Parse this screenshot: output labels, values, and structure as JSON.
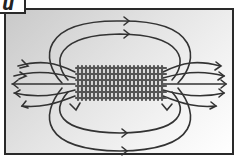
{
  "figure": {
    "label": "u",
    "colors": {
      "line": "#333333",
      "coil": "#555555",
      "frame": "#2a2a2a"
    }
  },
  "diagram": {
    "nodes": [
      {
        "id": "solenoid",
        "type": "coil",
        "turns": 22
      },
      {
        "id": "field-lines-top",
        "count": 2,
        "arrow_direction": "right"
      },
      {
        "id": "field-lines-bottom",
        "count": 2,
        "arrow_direction": "right"
      },
      {
        "id": "field-lines-left-fan",
        "arrow_direction": "left"
      },
      {
        "id": "field-lines-right-fan",
        "arrow_direction": "right"
      }
    ]
  }
}
